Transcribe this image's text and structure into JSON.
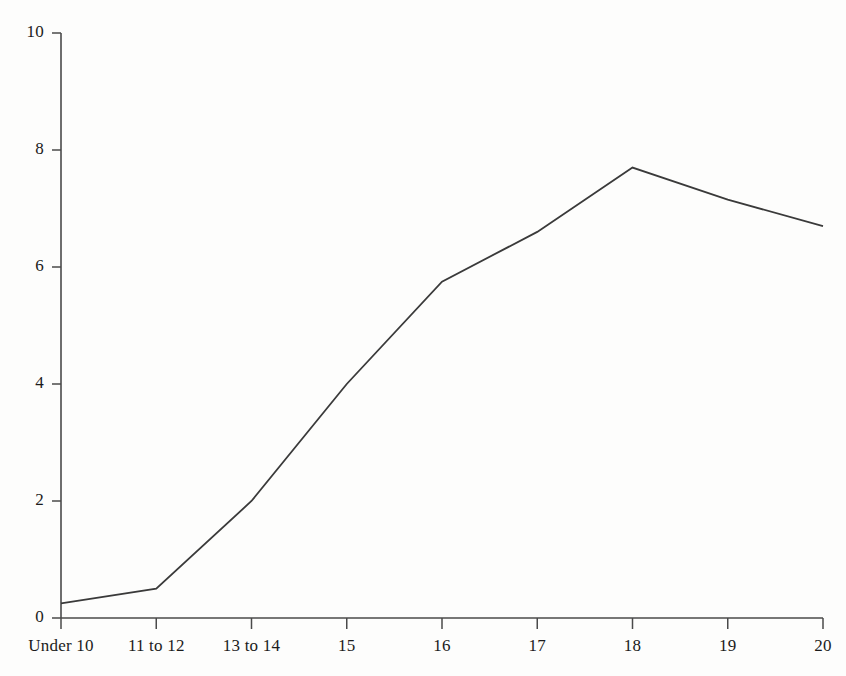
{
  "chart_data": {
    "type": "line",
    "title": "",
    "subtitle": "",
    "xlabel": "",
    "ylabel": "",
    "categories": [
      "Under 10",
      "11 to 12",
      "13 to 14",
      "15",
      "16",
      "17",
      "18",
      "19",
      "20"
    ],
    "values": [
      0.25,
      0.5,
      2.0,
      4.0,
      5.75,
      6.6,
      7.7,
      7.15,
      6.7
    ],
    "series": [
      {
        "name": "series-1",
        "values": [
          0.25,
          0.5,
          2.0,
          4.0,
          5.75,
          6.6,
          7.7,
          7.15,
          6.7
        ]
      }
    ],
    "ylim": [
      0,
      10
    ],
    "ytick_labels": [
      "0",
      "2",
      "4",
      "6",
      "8",
      "10"
    ],
    "ytick_values": [
      0,
      2,
      4,
      6,
      8,
      10
    ],
    "xtick_labels": [
      "Under 10",
      "11 to 12",
      "13 to 14",
      "15",
      "16",
      "17",
      "18",
      "19",
      "20"
    ],
    "grid": false,
    "legend": false,
    "legend_position": "none",
    "line_color": "#3a3a3a",
    "axis_color": "#4a4a4a",
    "background_color": "#fdfdfc"
  },
  "axes": {
    "y_axis_name": "y-axis",
    "x_axis_name": "x-axis"
  }
}
